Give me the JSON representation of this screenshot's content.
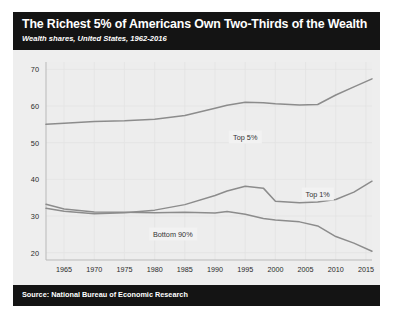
{
  "header": {
    "title": "The Richest 5% of Americans Own Two-Thirds of the Wealth",
    "subtitle": "Wealth shares, United States, 1962-2016"
  },
  "footer": {
    "source": "Source: National Bureau of Economic Research"
  },
  "chart_data": {
    "type": "line",
    "title": "The Richest 5% of Americans Own Two-Thirds of the Wealth",
    "subtitle": "Wealth shares, United States, 1962-2016",
    "xlabel": "",
    "ylabel": "",
    "xlim": [
      1962,
      2016
    ],
    "ylim": [
      18,
      72
    ],
    "grid": true,
    "legend_position": "inline-labels",
    "xticks": [
      1965,
      1970,
      1975,
      1980,
      1985,
      1990,
      1995,
      2000,
      2005,
      2010,
      2015
    ],
    "yticks": [
      20,
      30,
      40,
      50,
      60,
      70
    ],
    "x": [
      1962,
      1965,
      1970,
      1975,
      1980,
      1985,
      1990,
      1992,
      1995,
      1998,
      2000,
      2004,
      2007,
      2010,
      2013,
      2016
    ],
    "series": [
      {
        "name": "Top 5%",
        "label": "Top 5%",
        "color": "#8c8c8c",
        "values": [
          55.0,
          55.3,
          55.8,
          56.0,
          56.4,
          57.4,
          59.4,
          60.2,
          61.0,
          60.9,
          60.6,
          60.3,
          60.4,
          63.0,
          65.2,
          67.4
        ]
      },
      {
        "name": "Top 1%",
        "label": "Top 1%",
        "color": "#8c8c8c",
        "values": [
          32.1,
          31.3,
          30.6,
          30.9,
          31.6,
          33.1,
          35.6,
          36.8,
          38.1,
          37.6,
          34.0,
          33.6,
          33.8,
          34.5,
          36.5,
          39.5
        ]
      },
      {
        "name": "Bottom 90%",
        "label": "Bottom 90%",
        "color": "#8c8c8c",
        "values": [
          33.2,
          31.9,
          31.1,
          31.0,
          30.9,
          31.0,
          30.8,
          31.2,
          30.5,
          29.3,
          28.9,
          28.4,
          27.3,
          24.4,
          22.6,
          20.4
        ]
      }
    ],
    "annotations": [
      {
        "text": "Top 5%",
        "x": 1995,
        "y": 51.5
      },
      {
        "text": "Top 1%",
        "x": 2007,
        "y": 36.0
      },
      {
        "text": "Bottom 90%",
        "x": 1983,
        "y": 25.0
      }
    ]
  }
}
